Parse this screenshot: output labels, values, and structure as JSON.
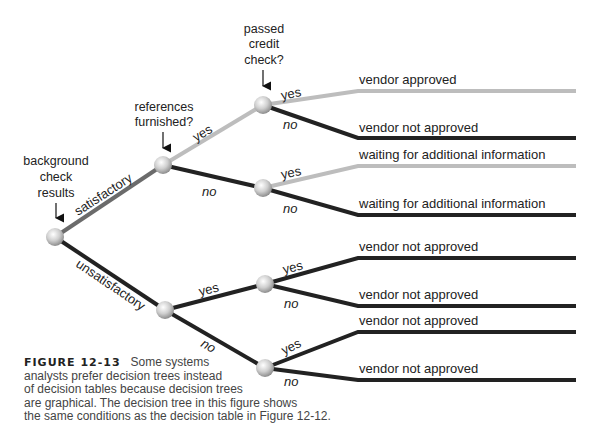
{
  "diagram": {
    "type": "decision-tree",
    "colors": {
      "satisfactory_edge": "#6b6b6b",
      "yes_edge_light": "#bdbdbd",
      "dark_edge": "#222222",
      "node": "#d6d6d6"
    },
    "conditions": {
      "root": [
        "background",
        "check",
        "results"
      ],
      "references": [
        "references",
        "furnished?"
      ],
      "credit": [
        "passed",
        "credit",
        "check?"
      ]
    },
    "edge_labels": {
      "satisfactory": "satisfactory",
      "unsatisfactory": "unsatisfactory",
      "yes": "yes",
      "no": "no"
    },
    "outcomes": [
      "vendor approved",
      "vendor not approved",
      "waiting for additional information",
      "waiting for additional information",
      "vendor not approved",
      "vendor not approved",
      "vendor not approved",
      "vendor not approved"
    ]
  },
  "caption": {
    "figure_label": "FIGURE 12-13",
    "lines": [
      "Some systems",
      "analysts prefer decision trees instead",
      "of decision tables because decision trees",
      "are graphical. The decision tree in this figure shows",
      "the same conditions as the decision table in Figure 12-12."
    ]
  }
}
